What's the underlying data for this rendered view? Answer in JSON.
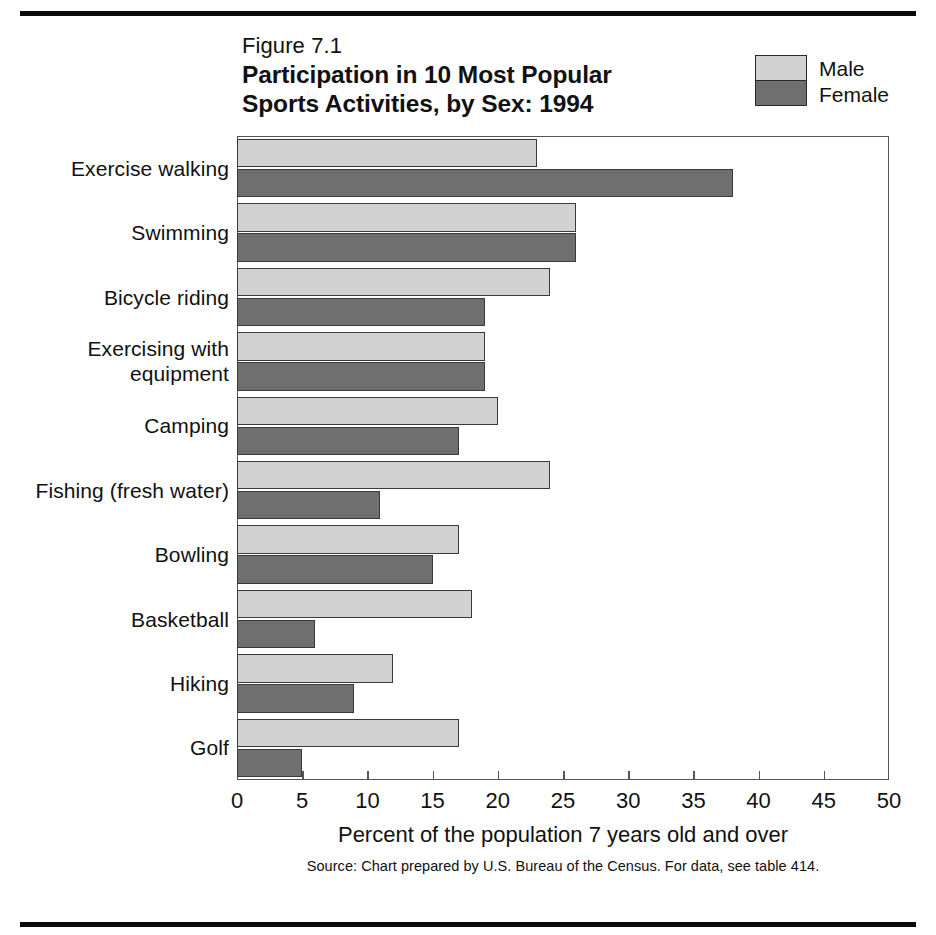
{
  "page": {
    "header_ghost_text": "",
    "rules": {
      "color": "#0b0b0b"
    }
  },
  "figure": {
    "number": "Figure 7.1",
    "title_line1": "Participation in 10 Most Popular",
    "title_line2": "Sports Activities, by Sex: 1994",
    "xaxis_title": "Percent of the population 7 years old and over",
    "source_note": "Source: Chart prepared by U.S. Bureau of the Census. For data, see table 414."
  },
  "legend": {
    "male_label": "Male",
    "female_label": "Female",
    "male_color": "#d2d2d2",
    "female_color": "#6f6f6f"
  },
  "chart_data": {
    "type": "bar",
    "orientation": "horizontal",
    "title": "Participation in 10 Most Popular Sports Activities, by Sex: 1994",
    "subtitle": "Figure 7.1",
    "xlabel": "Percent of the population 7 years old and over",
    "ylabel": "",
    "xlim": [
      0,
      50
    ],
    "xticks": [
      0,
      5,
      10,
      15,
      20,
      25,
      30,
      35,
      40,
      45,
      50
    ],
    "xticklabels": [
      "0",
      "5",
      "10",
      "15",
      "20",
      "25",
      "30",
      "35",
      "40",
      "45",
      "50"
    ],
    "grid": false,
    "legend_position": "top-right",
    "categories": [
      "Exercise walking",
      "Swimming",
      "Bicycle riding",
      "Exercising with equipment",
      "Camping",
      "Fishing (fresh water)",
      "Bowling",
      "Basketball",
      "Hiking",
      "Golf"
    ],
    "category_label_lines": [
      [
        "Exercise walking"
      ],
      [
        "Swimming"
      ],
      [
        "Bicycle riding"
      ],
      [
        "Exercising with",
        "equipment"
      ],
      [
        "Camping"
      ],
      [
        "Fishing (fresh water)"
      ],
      [
        "Bowling"
      ],
      [
        "Basketball"
      ],
      [
        "Hiking"
      ],
      [
        "Golf"
      ]
    ],
    "series": [
      {
        "name": "Male",
        "color": "#d2d2d2",
        "values": [
          23,
          26,
          24,
          19,
          20,
          24,
          17,
          18,
          12,
          17
        ]
      },
      {
        "name": "Female",
        "color": "#6f6f6f",
        "values": [
          38,
          26,
          19,
          19,
          17,
          11,
          15,
          6,
          9,
          5
        ]
      }
    ]
  }
}
